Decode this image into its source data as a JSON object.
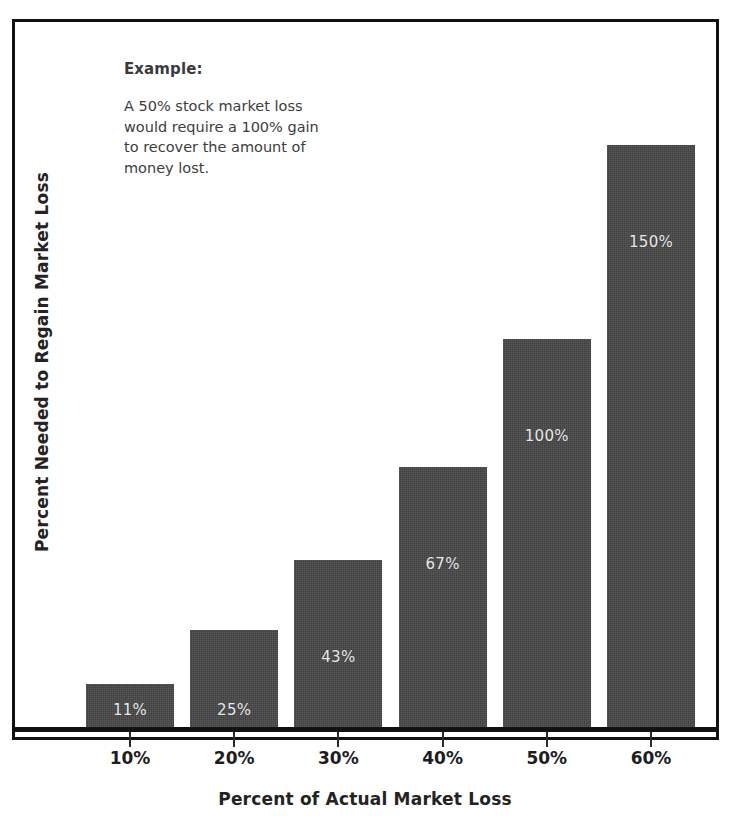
{
  "chart_data": {
    "type": "bar",
    "title": "",
    "xlabel": "Percent of Actual Market Loss",
    "ylabel": "Percent Needed to Regain Market Loss",
    "categories": [
      "10%",
      "20%",
      "30%",
      "40%",
      "50%",
      "60%"
    ],
    "values": [
      11,
      25,
      43,
      67,
      100,
      150
    ],
    "value_labels": [
      "11%",
      "25%",
      "43%",
      "67%",
      "100%",
      "150%"
    ],
    "ylim": [
      0,
      150
    ],
    "grid": false,
    "legend": null,
    "bar_color": "#474747",
    "value_label_color": "#e9e9e9",
    "annotation": {
      "heading": "Example:",
      "text": "A 50% stock market loss\nwould require a 100% gain\nto recover the amount of\nmoney lost."
    }
  },
  "figure": {
    "frame_color": "#111111",
    "background": "#ffffff"
  }
}
